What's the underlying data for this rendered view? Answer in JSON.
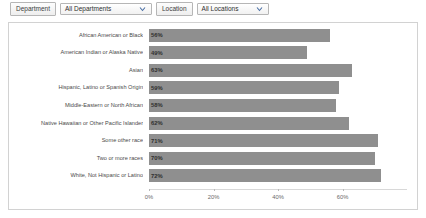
{
  "filters": [
    {
      "label": "Department",
      "value": "All Departments",
      "icon": "chevron-down-icon"
    },
    {
      "label": "Location",
      "value": "All Locations",
      "icon": "chevron-down-icon"
    }
  ],
  "colors": {
    "bar": "#8f8f8f",
    "panel_border": "#d2d2d2",
    "text": "#4a4a4a",
    "axis": "#d8d8d8"
  },
  "chart_data": {
    "type": "bar",
    "orientation": "horizontal",
    "title": "",
    "xlabel": "",
    "ylabel": "",
    "xlim": [
      0,
      80
    ],
    "grid": false,
    "legend": "none",
    "xticks": [
      "0%",
      "20%",
      "40%",
      "60%"
    ],
    "xtick_values": [
      0,
      20,
      40,
      60
    ],
    "categories": [
      "African American or Black",
      "American Indian or Alaska Native",
      "Asian",
      "Hispanic, Latino or Spanish Origin",
      "Middle-Eastern or North African",
      "Native Hawaiian or Other Pacific Islander",
      "Some other race",
      "Two or more races",
      "White, Not Hispanic or Latino"
    ],
    "values": [
      56,
      49,
      63,
      59,
      58,
      62,
      71,
      70,
      72
    ],
    "value_labels": [
      "56%",
      "49%",
      "63%",
      "59%",
      "58%",
      "62%",
      "71%",
      "70%",
      "72%"
    ]
  }
}
